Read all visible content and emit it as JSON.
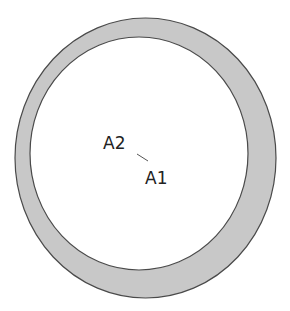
{
  "diagram": {
    "labels": {
      "a1": "A1",
      "a2": "A2"
    },
    "colors": {
      "ring_fill": "#c8c8c8",
      "ring_stroke": "#4a4a4a",
      "inner_fill": "#ffffff",
      "text": "#222222",
      "connector": "#555555"
    }
  }
}
